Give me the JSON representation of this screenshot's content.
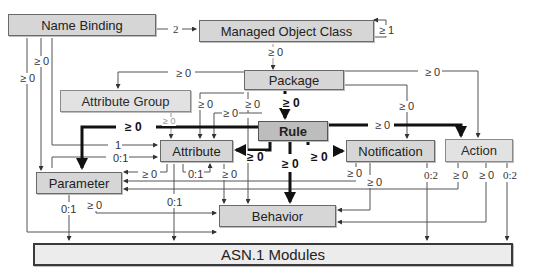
{
  "nodes": {
    "name_binding": {
      "label": "Name Binding",
      "x": 8,
      "y": 14,
      "w": 148,
      "h": 22
    },
    "managed_object_class": {
      "label": "Managed Object Class",
      "x": 199,
      "y": 20,
      "w": 175,
      "h": 22
    },
    "package": {
      "label": "Package",
      "x": 244,
      "y": 70,
      "w": 100,
      "h": 20
    },
    "attribute_group": {
      "label": "Attribute Group",
      "x": 60,
      "y": 90,
      "w": 131,
      "h": 22
    },
    "rule": {
      "label": "Rule",
      "x": 258,
      "y": 121,
      "w": 70,
      "h": 20
    },
    "attribute": {
      "label": "Attribute",
      "x": 160,
      "y": 140,
      "w": 73,
      "h": 22
    },
    "notification": {
      "label": "Notification",
      "x": 346,
      "y": 140,
      "w": 89,
      "h": 22
    },
    "action": {
      "label": "Action",
      "x": 445,
      "y": 139,
      "w": 68,
      "h": 23
    },
    "parameter": {
      "label": "Parameter",
      "x": 36,
      "y": 172,
      "w": 86,
      "h": 22
    },
    "behavior": {
      "label": "Behavior",
      "x": 219,
      "y": 205,
      "w": 117,
      "h": 22
    },
    "asn1_modules": {
      "label": "ASN.1 Modules",
      "x": 33,
      "y": 243,
      "w": 480,
      "h": 23
    }
  },
  "edge_labels": [
    {
      "id": "nb-moc",
      "text": "2",
      "x": 172,
      "y": 24,
      "style": "serif"
    },
    {
      "id": "moc-self",
      "text": "≥ 1",
      "x": 378,
      "y": 25,
      "style": ""
    },
    {
      "id": "moc-pkg",
      "text": "≥ 0",
      "x": 267,
      "y": 47,
      "style": ""
    },
    {
      "id": "nb-left-1",
      "text": "≥ 0",
      "x": 33,
      "y": 56,
      "style": ""
    },
    {
      "id": "nb-left-2",
      "text": "≥ 0",
      "x": 19,
      "y": 73,
      "style": ""
    },
    {
      "id": "pkg-attrgroup",
      "text": "≥ 0",
      "x": 175,
      "y": 68,
      "style": ""
    },
    {
      "id": "pkg-action",
      "text": "≥ 0",
      "x": 424,
      "y": 67,
      "style": ""
    },
    {
      "id": "pkg-attr-1",
      "text": "≥ 0",
      "x": 197,
      "y": 99,
      "style": ""
    },
    {
      "id": "pkg-attr-2",
      "text": "≥ 0",
      "x": 222,
      "y": 108,
      "style": ""
    },
    {
      "id": "pkg-behavior",
      "text": "≥ 0",
      "x": 244,
      "y": 99,
      "style": ""
    },
    {
      "id": "pkg-rule",
      "text": "≥ 0",
      "x": 282,
      "y": 97,
      "style": "bold"
    },
    {
      "id": "pkg-notif",
      "text": "≥ 0",
      "x": 398,
      "y": 101,
      "style": ""
    },
    {
      "id": "attrgroup-attr",
      "text": "≥ 0",
      "x": 162,
      "y": 117,
      "style": "faint"
    },
    {
      "id": "rule-param",
      "text": "≥ 0",
      "x": 124,
      "y": 121,
      "style": "bold"
    },
    {
      "id": "rule-action",
      "text": "≥ 0",
      "x": 374,
      "y": 120,
      "style": ""
    },
    {
      "id": "nb-attr",
      "text": "1",
      "x": 114,
      "y": 140,
      "style": ""
    },
    {
      "id": "nb-attr-2",
      "text": "0:1",
      "x": 112,
      "y": 153,
      "style": ""
    },
    {
      "id": "rule-attr",
      "text": "≥ 0",
      "x": 246,
      "y": 151,
      "style": "bold"
    },
    {
      "id": "rule-behavior",
      "text": "≥ 0",
      "x": 281,
      "y": 158,
      "style": "bold"
    },
    {
      "id": "rule-notif",
      "text": "≥ 0",
      "x": 310,
      "y": 151,
      "style": "bold"
    },
    {
      "id": "attr-param",
      "text": "≥ 0",
      "x": 141,
      "y": 169,
      "style": ""
    },
    {
      "id": "attr-01",
      "text": "0:1",
      "x": 187,
      "y": 169,
      "style": ""
    },
    {
      "id": "attr-beh",
      "text": "≥ 0",
      "x": 221,
      "y": 169,
      "style": ""
    },
    {
      "id": "notif-1",
      "text": "≥ 0",
      "x": 346,
      "y": 168,
      "style": ""
    },
    {
      "id": "notif-2",
      "text": "≥ 0",
      "x": 366,
      "y": 177,
      "style": ""
    },
    {
      "id": "notif-asn",
      "text": "0:2",
      "x": 423,
      "y": 170,
      "style": "serif"
    },
    {
      "id": "action-1",
      "text": "≥ 0",
      "x": 452,
      "y": 170,
      "style": ""
    },
    {
      "id": "action-2",
      "text": "≥ 0",
      "x": 478,
      "y": 170,
      "style": ""
    },
    {
      "id": "action-asn",
      "text": "0:2",
      "x": 502,
      "y": 170,
      "style": "serif"
    },
    {
      "id": "param-asn",
      "text": "0:1",
      "x": 60,
      "y": 204,
      "style": ""
    },
    {
      "id": "param-beh",
      "text": "≥ 0",
      "x": 86,
      "y": 200,
      "style": ""
    },
    {
      "id": "attr-asn",
      "text": "0:1",
      "x": 166,
      "y": 197,
      "style": ""
    }
  ],
  "colors": {
    "box_fill": "#d6d6d6",
    "box_light": "#e2e2e2",
    "rule_fill": "#bdbdbd",
    "line": "#555555",
    "thick_line": "#111111",
    "asn_fill": "#ececec"
  }
}
